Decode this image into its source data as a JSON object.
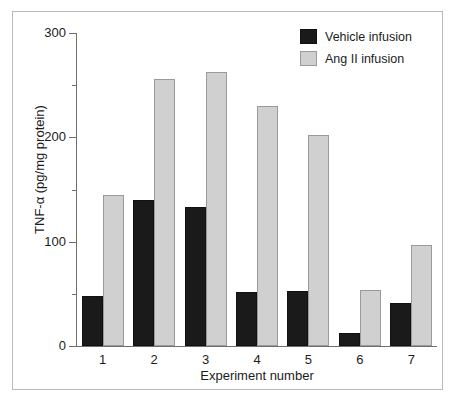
{
  "chart_data": {
    "type": "bar",
    "title": "",
    "xlabel": "Experiment number",
    "ylabel": "TNF-α (pg/mg protein)",
    "categories": [
      "1",
      "2",
      "3",
      "4",
      "5",
      "6",
      "7"
    ],
    "series": [
      {
        "name": "Vehicle infusion",
        "color": "#1a1a1a",
        "values": [
          48,
          140,
          133,
          52,
          53,
          12,
          41
        ]
      },
      {
        "name": "Ang II infusion",
        "color": "#d0d0d0",
        "values": [
          145,
          256,
          263,
          230,
          202,
          54,
          97
        ]
      }
    ],
    "ylim": [
      0,
      300
    ],
    "y_major_ticks": [
      0,
      100,
      200,
      300
    ],
    "y_minor_ticks": [
      50,
      150,
      250
    ],
    "y_tick_labels": [
      "0",
      "100",
      "200",
      "300"
    ],
    "grid": false,
    "legend_position": "top-right"
  },
  "axes": {
    "y_title": "TNF-α (pg/mg protein)",
    "x_title": "Experiment number",
    "y_labels": [
      "300",
      "200",
      "100",
      "0"
    ],
    "x_labels": [
      "1",
      "2",
      "3",
      "4",
      "5",
      "6",
      "7"
    ]
  },
  "legend": {
    "items": [
      {
        "label": "Vehicle infusion",
        "color": "#1a1a1a"
      },
      {
        "label": "Ang II infusion",
        "color": "#d0d0d0"
      }
    ]
  }
}
